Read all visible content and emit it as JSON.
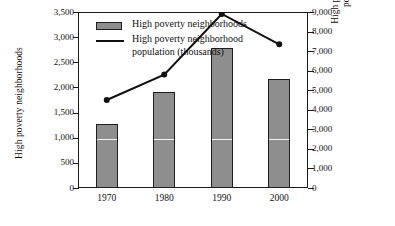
{
  "chart_data": {
    "type": "bar",
    "title": "",
    "subtitle": "",
    "categories": [
      "1970",
      "1980",
      "1990",
      "2000"
    ],
    "xlabel": "",
    "ylabel": "High poverty neighborhoods",
    "ylim": [
      0,
      3500
    ],
    "y_ticks": [
      "0",
      "500",
      "1,000",
      "1,500",
      "2,000",
      "2,500",
      "3,000",
      "3,500"
    ],
    "y_tick_values": [
      0,
      500,
      1000,
      1500,
      2000,
      2500,
      3000,
      3500
    ],
    "y2label": "High poverty neighborhood population (1000s)",
    "y2lim": [
      0,
      9000
    ],
    "y2_ticks": [
      "0",
      "1,000",
      "2,000",
      "3,000",
      "4,000",
      "5,000",
      "6,000",
      "7,000",
      "8,000",
      "9,000"
    ],
    "y2_tick_values": [
      0,
      1000,
      2000,
      3000,
      4000,
      5000,
      6000,
      7000,
      8000,
      9000
    ],
    "grid": false,
    "legend_position": "top-left-inside",
    "series": [
      {
        "name": "High poverty neighborhoods",
        "type": "bar",
        "axis": "left",
        "color": "#8e8e8e",
        "edge_color": "#1f1f1f",
        "values": [
          1270,
          1900,
          2790,
          2170
        ]
      },
      {
        "name": "High poverty neighborhood population (thousands)",
        "type": "line",
        "axis": "right",
        "color": "#111111",
        "marker": "circle",
        "values": [
          4500,
          5800,
          8900,
          7350
        ]
      }
    ]
  },
  "axes": {
    "left_title": "High poverty neighborhoods",
    "right_title_line1": "High poverty neighborhood",
    "right_title_line2": "population (1000s)"
  },
  "legend": {
    "items": [
      {
        "label": "High poverty neighborhoods",
        "marker": "bar-swatch"
      },
      {
        "label_line1": "High poverty neighborhood",
        "label_line2": "population (thousands)",
        "marker": "line-swatch"
      }
    ]
  }
}
